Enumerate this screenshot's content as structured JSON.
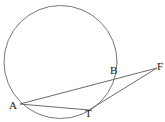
{
  "figure": {
    "background_color": "#ffffff",
    "stroke_color": "#6b6b6b",
    "label_color": "#1a1a1a",
    "width": 165,
    "height": 122
  },
  "circle": {
    "name": "circle",
    "cx": 60.5,
    "cy": 62,
    "r": 56.5,
    "stroke": "#777777",
    "stroke_width": 1,
    "fill": "none"
  },
  "points": [
    {
      "id": "A",
      "label": "A",
      "x": 20,
      "y": 104,
      "label_x": 9,
      "label_y": 100,
      "on_circle": true
    },
    {
      "id": "B",
      "label": "B",
      "x": 106,
      "y": 80,
      "label_x": 110,
      "label_y": 65,
      "on_circle": true
    },
    {
      "id": "T",
      "label": "T",
      "x": 89,
      "y": 110,
      "label_x": 85,
      "label_y": 108,
      "on_circle": true
    },
    {
      "id": "F",
      "label": "F",
      "x": 157,
      "y": 68,
      "label_x": 157,
      "label_y": 61,
      "on_circle": false
    }
  ],
  "segments": [
    {
      "id": "AF",
      "label": "A-F secant",
      "from": "A",
      "to": "F",
      "x1": 20,
      "y1": 104,
      "x2": 157,
      "y2": 68
    },
    {
      "id": "AT",
      "label": "A-T chord",
      "from": "A",
      "to": "T",
      "x1": 20,
      "y1": 104,
      "x2": 89,
      "y2": 110
    },
    {
      "id": "TF",
      "label": "T-F tangent",
      "from": "T",
      "to": "F",
      "x1": 89,
      "y1": 110,
      "x2": 157,
      "y2": 68
    }
  ],
  "labels": {
    "A": "A",
    "B": "B",
    "T": "T",
    "F": "F"
  }
}
